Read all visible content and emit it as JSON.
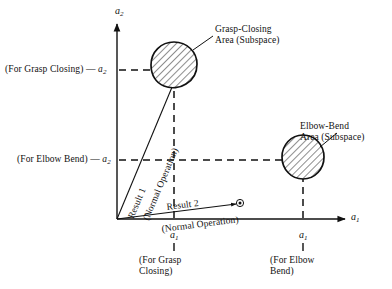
{
  "figure": {
    "background_color": "#ffffff",
    "line_color": "#111111",
    "hatch_color": "#555555"
  },
  "axes": {
    "y_axis_label": "a",
    "y_axis_subscript": "2",
    "x_axis_label": "a",
    "x_axis_subscript": "1"
  },
  "y_ticks": [
    {
      "label_prefix": "(For Grasp Closing)",
      "dash": "—",
      "symbol": "a",
      "subscript": "2"
    },
    {
      "label_prefix": "(For Elbow Bend)",
      "dash": "—",
      "symbol": "a",
      "subscript": "2"
    }
  ],
  "x_ticks": [
    {
      "symbol": "a",
      "subscript": "1",
      "caption_line1": "(For Grasp",
      "caption_line2": "Closing)"
    },
    {
      "symbol": "a",
      "subscript": "1",
      "caption_line1": "(For Elbow",
      "caption_line2": "Bend)"
    }
  ],
  "regions": [
    {
      "name": "grasp-closing-area",
      "annotation_line1": "Grasp-Closing",
      "annotation_line2": "Area (Subspace)"
    },
    {
      "name": "elbow-bend-area",
      "annotation_line1": "Elbow-Bend",
      "annotation_line2": "Area (Subspace)"
    }
  ],
  "vectors": [
    {
      "name": "result-1",
      "label": "Result 1",
      "sublabel": "(Normal Operation)"
    },
    {
      "name": "result-2",
      "label": "Result 2",
      "sublabel": "(Normal Operation)"
    }
  ],
  "markers": [
    {
      "name": "result-2-target-marker",
      "glyph": "⊛"
    }
  ]
}
